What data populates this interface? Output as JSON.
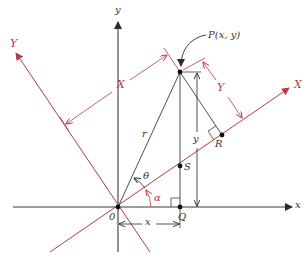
{
  "diagram": {
    "colors": {
      "axes": "#3a3a3a",
      "rotated_axes": "#b23a48",
      "background": "#ffffff"
    },
    "labels": {
      "x_axis": "x",
      "y_axis": "y",
      "X_axis": "X",
      "Y_axis": "Y",
      "origin": "0",
      "point_P": "P(x, y)",
      "point_Q": "Q",
      "point_R": "R",
      "point_S": "S",
      "radius": "r",
      "theta": "θ",
      "alpha": "α",
      "dim_X": "X",
      "dim_Y": "Y",
      "dim_x": "x",
      "dim_y": "y"
    },
    "points": {
      "O": [
        118,
        207
      ],
      "P": [
        180,
        72
      ],
      "Q": [
        180,
        207
      ],
      "S": [
        180,
        166
      ],
      "R": [
        222,
        135
      ]
    }
  }
}
